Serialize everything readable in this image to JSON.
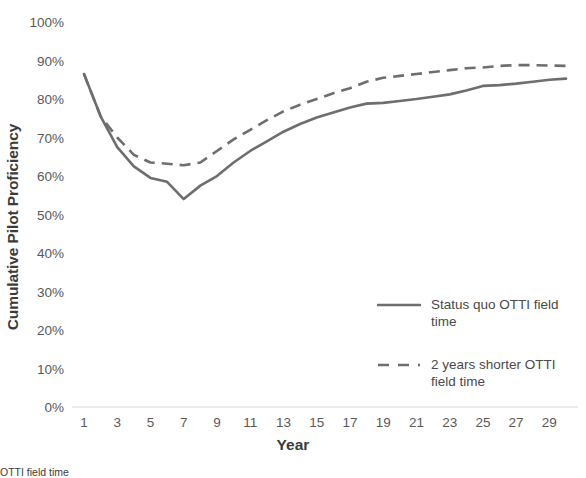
{
  "chart_data": {
    "type": "line",
    "title": "",
    "xlabel": "Year",
    "ylabel": "Cumulative Pilot Proficiency",
    "xlim": [
      1,
      30
    ],
    "ylim": [
      0,
      1.0
    ],
    "grid": false,
    "legend_position": "inside-right",
    "y_tick_labels": [
      "100%",
      "90%",
      "80%",
      "70%",
      "60%",
      "50%",
      "40%",
      "30%",
      "20%",
      "10%",
      "0%"
    ],
    "y_tick_values": [
      1.0,
      0.9,
      0.8,
      0.7,
      0.6,
      0.5,
      0.4,
      0.3,
      0.2,
      0.1,
      0.0
    ],
    "x_tick_labels": [
      "1",
      "3",
      "5",
      "7",
      "9",
      "11",
      "13",
      "15",
      "17",
      "19",
      "21",
      "23",
      "25",
      "27",
      "29"
    ],
    "x_tick_values": [
      1,
      3,
      5,
      7,
      9,
      11,
      13,
      15,
      17,
      19,
      21,
      23,
      25,
      27,
      29
    ],
    "x": [
      1,
      2,
      3,
      4,
      5,
      6,
      7,
      8,
      9,
      10,
      11,
      12,
      13,
      14,
      15,
      16,
      17,
      18,
      19,
      20,
      21,
      22,
      23,
      24,
      25,
      26,
      27,
      28,
      29,
      30
    ],
    "series": [
      {
        "name": "Status quo OTTI field time",
        "style": "solid",
        "color": "#6E6E6E",
        "values": [
          0.865,
          0.755,
          0.675,
          0.625,
          0.595,
          0.585,
          0.54,
          0.575,
          0.6,
          0.635,
          0.665,
          0.69,
          0.715,
          0.735,
          0.752,
          0.765,
          0.778,
          0.788,
          0.79,
          0.795,
          0.8,
          0.806,
          0.812,
          0.822,
          0.834,
          0.836,
          0.84,
          0.845,
          0.85,
          0.853
        ]
      },
      {
        "name": "2 years shorter OTTI field time",
        "style": "dashed",
        "color": "#6E6E6E",
        "values": [
          0.865,
          0.755,
          0.7,
          0.655,
          0.635,
          0.632,
          0.628,
          0.635,
          0.665,
          0.695,
          0.72,
          0.745,
          0.768,
          0.785,
          0.8,
          0.815,
          0.828,
          0.845,
          0.855,
          0.86,
          0.865,
          0.87,
          0.875,
          0.88,
          0.882,
          0.886,
          0.888,
          0.888,
          0.887,
          0.886
        ]
      }
    ]
  },
  "legend": {
    "entries": [
      {
        "label": "Status quo OTTI field time",
        "style": "solid"
      },
      {
        "label": "2 years shorter OTTI field time",
        "style": "dashed"
      }
    ]
  },
  "caption": {
    "text": "OTTI field time"
  }
}
